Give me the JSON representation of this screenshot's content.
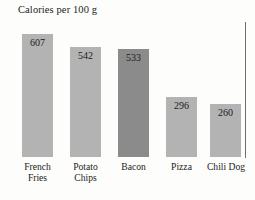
{
  "chart_data": {
    "type": "bar",
    "title": "Calories per 100 g",
    "xlabel": "",
    "ylabel": "",
    "ylim": [
      0,
      660
    ],
    "grid": false,
    "legend": "none",
    "orientation": "vertical",
    "categories": [
      "French\nFries",
      "Potato\nChips",
      "Bacon",
      "Pizza",
      "Chili Dog"
    ],
    "values": [
      607,
      542,
      533,
      296,
      260
    ],
    "value_labels": [
      "607",
      "542",
      "533",
      "296",
      "260"
    ],
    "value_label_position": "inside-top",
    "bar_colors": [
      "#b3b3b3",
      "#b3b3b3",
      "#8b8b8b",
      "#b3b3b3",
      "#b3b3b3"
    ],
    "highlighted_category": "Bacon",
    "axis_line_color": "#6f6f6f",
    "background_color": "#fdfdfc",
    "text_color": "#1b1b1b"
  },
  "bars": [
    {
      "label": "French\nFries",
      "value_label": "607",
      "color": "#b3b3b3",
      "left": 22,
      "width": 31,
      "height": 123,
      "label_left": 14,
      "label_width": 47
    },
    {
      "label": "Potato\nChips",
      "value_label": "542",
      "color": "#b3b3b3",
      "left": 70,
      "width": 31,
      "height": 110,
      "label_left": 62,
      "label_width": 47
    },
    {
      "label": "Bacon",
      "value_label": "533",
      "color": "#8b8b8b",
      "left": 118,
      "width": 31,
      "height": 108,
      "label_left": 110,
      "label_width": 47
    },
    {
      "label": "Pizza",
      "value_label": "296",
      "color": "#b3b3b3",
      "left": 166,
      "width": 31,
      "height": 60,
      "label_left": 158,
      "label_width": 47
    },
    {
      "label": "Chili Dog",
      "value_label": "260",
      "color": "#b3b3b3",
      "left": 210,
      "width": 31,
      "height": 53,
      "label_left": 200,
      "label_width": 52
    }
  ],
  "geometry": {
    "baseline_y": 157,
    "label_top_y": 161
  }
}
